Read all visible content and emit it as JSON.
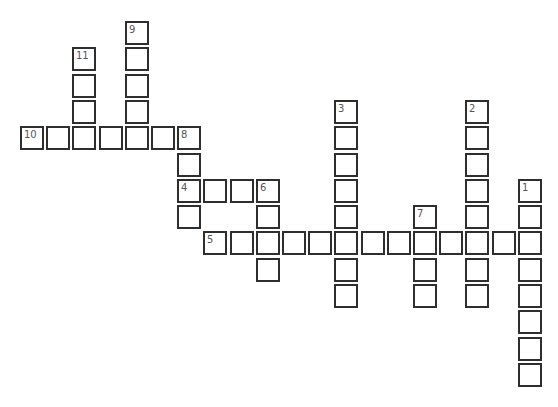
{
  "puzzle": {
    "type": "crossword",
    "grid": {
      "origin_x": 20,
      "origin_y": 21,
      "pitch_x": 26.2,
      "pitch_y": 26.3
    },
    "entries": [
      {
        "number": "1",
        "direction": "down",
        "col": 19,
        "row": 6,
        "length": 8
      },
      {
        "number": "2",
        "direction": "down",
        "col": 17,
        "row": 3,
        "length": 8
      },
      {
        "number": "3",
        "direction": "down",
        "col": 12,
        "row": 3,
        "length": 8
      },
      {
        "number": "4",
        "direction": "across",
        "col": 6,
        "row": 6,
        "length": 4
      },
      {
        "number": "5",
        "direction": "across",
        "col": 7,
        "row": 8,
        "length": 13
      },
      {
        "number": "6",
        "direction": "down",
        "col": 9,
        "row": 6,
        "length": 4
      },
      {
        "number": "7",
        "direction": "down",
        "col": 15,
        "row": 7,
        "length": 4
      },
      {
        "number": "8",
        "direction": "down",
        "col": 6,
        "row": 4,
        "length": 4
      },
      {
        "number": "9",
        "direction": "down",
        "col": 4,
        "row": 0,
        "length": 5
      },
      {
        "number": "10",
        "direction": "across",
        "col": 0,
        "row": 4,
        "length": 7
      },
      {
        "number": "11",
        "direction": "down",
        "col": 2,
        "row": 1,
        "length": 4
      }
    ]
  }
}
